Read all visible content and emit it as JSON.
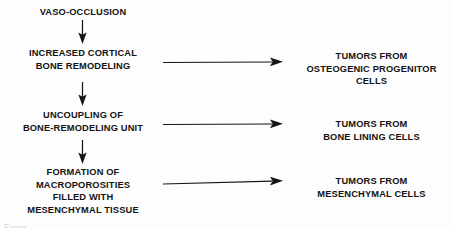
{
  "diagram": {
    "type": "flowchart",
    "background_color": "#fdfdfd",
    "ink_color": "#151515",
    "pathway_nodes": [
      {
        "id": "vaso-occlusion",
        "text": "VASO-OCCLUSION"
      },
      {
        "id": "increased-cortical-bone-remodeling",
        "text": "INCREASED CORTICAL\nBONE REMODELING"
      },
      {
        "id": "uncoupling-of-bone-remodeling-unit",
        "text": "UNCOUPLING OF\nBONE-REMODELING UNIT"
      },
      {
        "id": "formation-of-macroporosities",
        "text": "FORMATION OF\nMACROPOROSITIES\nFILLED WITH\nMESENCHYMAL TISSUE"
      }
    ],
    "outcome_nodes": [
      {
        "id": "tumors-osteogenic-progenitor-cells",
        "text": "TUMORS FROM\nOSTEOGENIC PROGENITOR\nCELLS"
      },
      {
        "id": "tumors-bone-lining-cells",
        "text": "TUMORS FROM\nBONE LINING CELLS"
      },
      {
        "id": "tumors-mesenchymal-cells",
        "text": "TUMORS FROM\nMESENCHYMAL CELLS"
      }
    ],
    "vertical_arrows": [
      {
        "id": "arrow-vaso-to-cortical",
        "from": "vaso-occlusion",
        "to": "increased-cortical-bone-remodeling"
      },
      {
        "id": "arrow-cortical-to-uncoupling",
        "from": "increased-cortical-bone-remodeling",
        "to": "uncoupling-of-bone-remodeling-unit"
      },
      {
        "id": "arrow-uncoupling-to-macroporosities",
        "from": "uncoupling-of-bone-remodeling-unit",
        "to": "formation-of-macroporosities"
      }
    ],
    "horizontal_arrows": [
      {
        "id": "arrow-cortical-to-osteogenic",
        "from": "increased-cortical-bone-remodeling",
        "to": "tumors-osteogenic-progenitor-cells"
      },
      {
        "id": "arrow-uncoupling-to-bone-lining",
        "from": "uncoupling-of-bone-remodeling-unit",
        "to": "tumors-bone-lining-cells"
      },
      {
        "id": "arrow-macroporosities-to-mesenchymal",
        "from": "formation-of-macroporosities",
        "to": "tumors-mesenchymal-cells"
      }
    ],
    "bottom_cropped_text": "Figure"
  }
}
